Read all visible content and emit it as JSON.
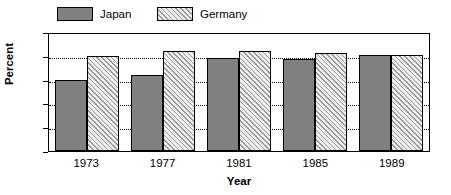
{
  "chart_data": {
    "type": "bar",
    "title": "",
    "xlabel": "Year",
    "ylabel": "Percent",
    "categories": [
      "1973",
      "1977",
      "1981",
      "1985",
      "1989"
    ],
    "series": [
      {
        "name": "Japan",
        "values": [
          60,
          64,
          78,
          77,
          81
        ],
        "color": "#808080",
        "fill": "solid"
      },
      {
        "name": "Germany",
        "values": [
          80,
          84,
          84,
          82,
          81
        ],
        "color": "#e8e8e8",
        "fill": "diagonal-hatch"
      }
    ],
    "ylim": [
      0,
      100
    ],
    "yticks": [
      "0",
      "20",
      "40",
      "60",
      "80",
      "100"
    ],
    "grid": "horizontal-dotted",
    "legend_position": "top-left"
  },
  "legend": {
    "items": [
      {
        "label": "Japan",
        "swatch": "solid-gray-swatch"
      },
      {
        "label": "Germany",
        "swatch": "hatched-swatch"
      }
    ]
  },
  "axes": {
    "y_title": "Percent",
    "x_title": "Year"
  }
}
